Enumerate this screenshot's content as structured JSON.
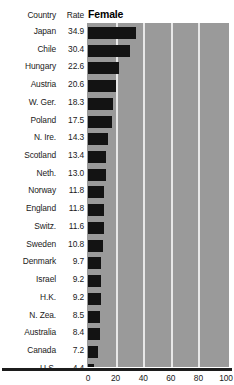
{
  "header": {
    "country_label": "Country",
    "rate_label": "Rate"
  },
  "title": "Female",
  "chart_data": {
    "type": "bar",
    "title": "Female",
    "orientation": "horizontal",
    "xlabel": "",
    "ylabel": "",
    "xlim": [
      0,
      100
    ],
    "xticks": [
      0,
      20,
      40,
      60,
      80,
      100
    ],
    "xtick_labels": [
      "0",
      "20",
      "40",
      "60",
      "80",
      "100"
    ],
    "grid": true,
    "gridlines_at": [
      20,
      40,
      60,
      80
    ],
    "legend": "none",
    "bar_color": "#131313",
    "plot_background": "#9a9a9a",
    "categories": [
      "Japan",
      "Chile",
      "Hungary",
      "Austria",
      "W. Ger.",
      "Poland",
      "N. Ire.",
      "Scotland",
      "Neth.",
      "Norway",
      "England",
      "Switz.",
      "Sweden",
      "Denmark",
      "Israel",
      "H.K.",
      "N. Zea.",
      "Australia",
      "Canada",
      "U.S."
    ],
    "values": [
      34.9,
      30.4,
      22.6,
      20.6,
      18.3,
      17.5,
      14.3,
      13.4,
      13.0,
      11.8,
      11.8,
      11.6,
      10.8,
      9.7,
      9.2,
      9.2,
      8.5,
      8.4,
      7.2,
      4.4
    ],
    "value_labels": [
      "34.9",
      "30.4",
      "22.6",
      "20.6",
      "18.3",
      "17.5",
      "14.3",
      "13.4",
      "13.0",
      "11.8",
      "11.8",
      "11.6",
      "10.8",
      "9.7",
      "9.2",
      "9.2",
      "8.5",
      "8.4",
      "7.2",
      "4.4"
    ]
  }
}
